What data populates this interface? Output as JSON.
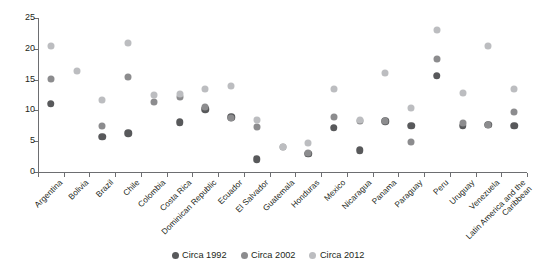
{
  "chart_data": {
    "type": "scatter",
    "title": "",
    "xlabel": "",
    "ylabel": "Percent",
    "ylim": [
      0,
      25
    ],
    "yticks": [
      0,
      5,
      10,
      15,
      20,
      25
    ],
    "grid": false,
    "legend_position": "bottom-center",
    "categories": [
      "Argentina",
      "Bolivia",
      "Brazil",
      "Chile",
      "Colombia",
      "Costa Rica",
      "Dominican Republic",
      "Ecuador",
      "El Salvador",
      "Guatemala",
      "Honduras",
      "Mexico",
      "Nicaragua",
      "Panama",
      "Paraguay",
      "Peru",
      "Uruguay",
      "Venezuela",
      "Latin America and the Caribbean"
    ],
    "series": [
      {
        "name": "Circa 1992",
        "color": "#58595b",
        "values": [
          11.1,
          null,
          5.7,
          6.3,
          null,
          8.1,
          10.2,
          8.9,
          2.1,
          null,
          3.0,
          7.2,
          3.5,
          8.2,
          7.5,
          15.6,
          7.5,
          7.7,
          7.5
        ]
      },
      {
        "name": "Circa 2002",
        "color": "#8c8c8e",
        "values": [
          15.1,
          null,
          7.5,
          15.4,
          11.3,
          12.1,
          10.6,
          8.7,
          7.3,
          4.1,
          3.1,
          8.9,
          8.2,
          8.3,
          4.8,
          18.4,
          7.9,
          7.7,
          9.8
        ]
      },
      {
        "name": "Circa 2012",
        "color": "#bcbdc0",
        "values": [
          20.4,
          16.4,
          11.7,
          21.0,
          12.5,
          12.7,
          13.4,
          13.9,
          8.5,
          4.1,
          4.7,
          13.5,
          8.5,
          16.0,
          10.4,
          23.1,
          12.9,
          20.4,
          13.4
        ]
      }
    ],
    "legend": [
      {
        "label": "Circa 1992",
        "color": "#58595b"
      },
      {
        "label": "Circa 2002",
        "color": "#8c8c8e"
      },
      {
        "label": "Circa 2012",
        "color": "#bcbdc0"
      }
    ]
  }
}
